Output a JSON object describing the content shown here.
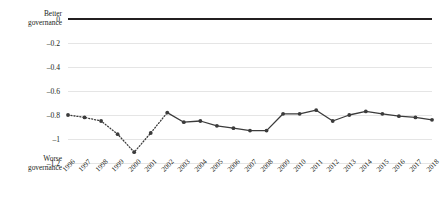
{
  "chart_data": {
    "type": "line",
    "title": "",
    "xlabel": "",
    "ylabel": "",
    "ylim": [
      -1.2,
      0
    ],
    "yticks": [
      0,
      -0.2,
      -0.4,
      -0.6,
      -0.8,
      -1,
      -1.2
    ],
    "ytick_labels": [
      "0",
      "–0.2",
      "–0.4",
      "–0.6",
      "–0.8",
      "–1",
      "–1.2"
    ],
    "grid": true,
    "legend": "none",
    "annotations": {
      "top_axis_label": "Better governance",
      "top_axis_label_line1": "Better",
      "top_axis_label_line2": "governance",
      "bottom_axis_label": "Worse governance",
      "bottom_axis_label_line1": "Worse",
      "bottom_axis_label_line2": "governance"
    },
    "categories": [
      "1996",
      "1997",
      "1998",
      "1999",
      "2000",
      "2001",
      "2002",
      "2003",
      "2004",
      "2005",
      "2006",
      "2007",
      "2008",
      "2009",
      "2010",
      "2011",
      "2012",
      "2013",
      "2014",
      "2015",
      "2016",
      "2017",
      "2018"
    ],
    "values": [
      -0.8,
      -0.82,
      -0.85,
      -0.96,
      -1.11,
      -0.95,
      -0.78,
      -0.86,
      -0.85,
      -0.89,
      -0.91,
      -0.93,
      -0.93,
      -0.79,
      -0.79,
      -0.76,
      -0.85,
      -0.8,
      -0.77,
      -0.79,
      -0.81,
      -0.82,
      -0.84
    ],
    "series": [
      {
        "name": "Governance index",
        "values": [
          -0.8,
          -0.82,
          -0.85,
          -0.96,
          -1.11,
          -0.95,
          -0.78,
          -0.86,
          -0.85,
          -0.89,
          -0.91,
          -0.93,
          -0.93,
          -0.79,
          -0.79,
          -0.76,
          -0.85,
          -0.8,
          -0.77,
          -0.79,
          -0.81,
          -0.82,
          -0.84
        ],
        "line_style_by_segment": {
          "dotted_through_index": 6,
          "solid_from_index": 6
        },
        "marker": "circle",
        "color": "#3b3b3b"
      }
    ],
    "colors": {
      "line": "#3b3b3b",
      "marker": "#3b3b3b",
      "zero_axis": "#231f20",
      "gridline": "#d4d4d4",
      "text": "#231f20",
      "background": "#ffffff"
    }
  }
}
